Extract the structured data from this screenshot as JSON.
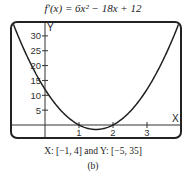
{
  "chart_data": {
    "type": "line",
    "title": "f′(x) = 6x² − 18x + 12",
    "function": "6x^2 - 18x + 12",
    "xlabel": "X",
    "ylabel": "Y",
    "xlim": [
      -1,
      4
    ],
    "ylim": [
      -5,
      35
    ],
    "x_ticks": [
      1,
      2,
      3
    ],
    "y_ticks": [
      5,
      10,
      15,
      20,
      25,
      30
    ],
    "grid": false,
    "legend": null,
    "series": [
      {
        "name": "f′(x)",
        "x": [
          -1,
          -0.5,
          0,
          0.5,
          1,
          1.5,
          2,
          2.5,
          3,
          3.5,
          4
        ],
        "values": [
          36,
          22.5,
          12,
          4.5,
          0,
          -1.5,
          0,
          4.5,
          12,
          22.5,
          36
        ]
      }
    ],
    "annotations": [
      "X: [−1, 4] and Y: [−5, 35]",
      "(b)"
    ]
  },
  "caption": {
    "title": "f′(x) = 6x² − 18x + 12",
    "window": "X: [−1, 4] and Y: [−5, 35]",
    "sublabel": "(b)"
  },
  "axes": {
    "x_letter": "X",
    "y_letter": "Y",
    "x_tick_labels": [
      "1",
      "2",
      "3"
    ],
    "y_tick_labels": [
      "5",
      "10",
      "15",
      "20",
      "25",
      "30"
    ]
  },
  "colors": {
    "curve": "#222222",
    "frame": "#222222",
    "axis": "#333333"
  }
}
